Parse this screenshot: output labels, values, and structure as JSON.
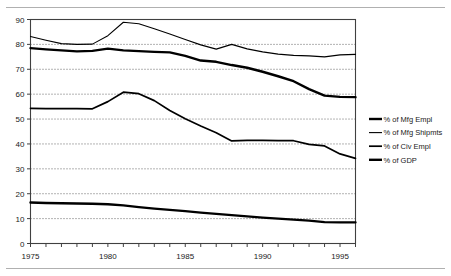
{
  "chart_data": {
    "type": "line",
    "title": "",
    "subtitle": "",
    "xlabel": "",
    "ylabel": "",
    "xlim": [
      1975,
      1996
    ],
    "ylim": [
      0,
      90
    ],
    "ytick_labels": [
      "0",
      "10",
      "20",
      "30",
      "40",
      "50",
      "60",
      "70",
      "80",
      "90"
    ],
    "ytick_values": [
      0,
      10,
      20,
      30,
      40,
      50,
      60,
      70,
      80,
      90
    ],
    "xtick_labels": [
      "1975",
      "1980",
      "1985",
      "1990",
      "1995"
    ],
    "xtick_values": [
      1975,
      1980,
      1985,
      1990,
      1995
    ],
    "xtick_minor_values": [
      1976,
      1977,
      1978,
      1979,
      1981,
      1982,
      1983,
      1984,
      1986,
      1987,
      1988,
      1989,
      1991,
      1992,
      1993,
      1994,
      1996
    ],
    "grid": "horizontal-dotted",
    "legend_position": "right",
    "x": [
      1975,
      1976,
      1977,
      1978,
      1979,
      1980,
      1981,
      1982,
      1983,
      1984,
      1985,
      1986,
      1987,
      1988,
      1989,
      1990,
      1991,
      1992,
      1993,
      1994,
      1995,
      1996
    ],
    "series": [
      {
        "name": "% of Mfg Empl",
        "width": "thick",
        "values": [
          78.5,
          78.0,
          77.6,
          77.2,
          77.4,
          78.3,
          77.6,
          77.3,
          77.0,
          76.8,
          75.4,
          73.5,
          73.0,
          71.7,
          70.6,
          69.0,
          67.2,
          65.2,
          62.0,
          59.4,
          58.9,
          58.8
        ]
      },
      {
        "name": "% of Mfg Shipmts",
        "width": "thin",
        "values": [
          83.2,
          81.7,
          80.3,
          80.0,
          80.1,
          83.5,
          88.9,
          88.3,
          86.3,
          84.2,
          82.0,
          79.8,
          78.1,
          80.0,
          78.2,
          77.0,
          76.1,
          75.6,
          75.4,
          75.0,
          75.8,
          76.0
        ]
      },
      {
        "name": "% of Civ Empl",
        "width": "medium",
        "values": [
          54.3,
          54.2,
          54.2,
          54.2,
          54.1,
          57.0,
          60.8,
          60.2,
          57.4,
          53.4,
          50.1,
          47.2,
          44.5,
          41.2,
          41.4,
          41.4,
          41.3,
          41.3,
          39.8,
          39.2,
          36.0,
          34.2
        ]
      },
      {
        "name": "% of GDP",
        "width": "thick",
        "values": [
          16.5,
          16.3,
          16.2,
          16.1,
          16.0,
          15.8,
          15.3,
          14.6,
          14.0,
          13.5,
          13.0,
          12.4,
          11.9,
          11.4,
          10.9,
          10.4,
          10.0,
          9.6,
          9.2,
          8.6,
          8.5,
          8.5
        ]
      }
    ],
    "colors": {
      "line": "#000000",
      "grid": "#555555",
      "frame": "#404040",
      "rule": "#b0b0b0",
      "background": "#ffffff"
    }
  },
  "legend": {
    "items": [
      {
        "label": "% of Mfg Empl"
      },
      {
        "label": "% of Mfg Shipmts"
      },
      {
        "label": "% of Civ Empl"
      },
      {
        "label": "% of GDP"
      }
    ]
  }
}
